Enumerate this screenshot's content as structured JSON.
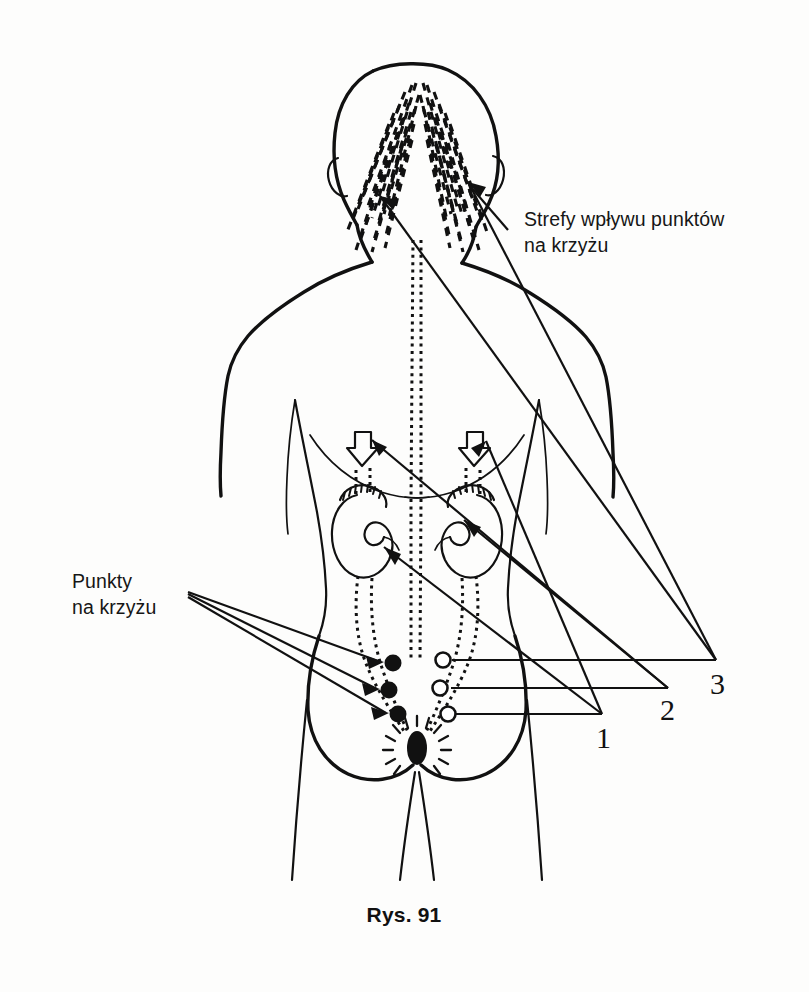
{
  "figure": {
    "caption": "Rys. 91",
    "language": "pl",
    "ink_color": "#111111",
    "background_color": "#ffffff"
  },
  "labels": {
    "zones": {
      "line1": "Strefy wpływu punktów",
      "line2": "na krzyżu"
    },
    "points": {
      "line1": "Punkty",
      "line2": "na krzyżu"
    }
  },
  "callout_numbers": [
    {
      "id": "1",
      "text": "1"
    },
    {
      "id": "2",
      "text": "2"
    },
    {
      "id": "3",
      "text": "3"
    }
  ],
  "anatomy": {
    "parts": [
      "head",
      "neck",
      "shoulders",
      "arms",
      "torso",
      "spine",
      "kidneys",
      "adrenal-glands",
      "ureters",
      "sacral-points",
      "coccyx",
      "buttocks",
      "legs"
    ],
    "sacral_points_left_filled": 3,
    "sacral_points_right_hollow": 3,
    "kidney_count": 2,
    "occipital_zone_count": 2
  }
}
